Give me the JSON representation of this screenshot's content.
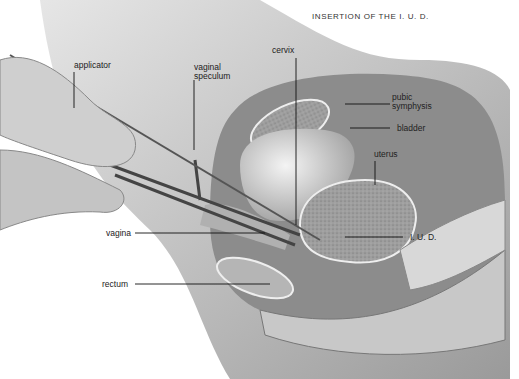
{
  "title": "INSERTION OF THE I. U. D.",
  "labels": {
    "applicator": "applicator",
    "vaginal_speculum_1": "vaginal",
    "vaginal_speculum_2": "speculum",
    "cervix": "cervix",
    "pubic_symphysis_1": "pubic",
    "pubic_symphysis_2": "symphysis",
    "bladder": "bladder",
    "uterus": "uterus",
    "vagina": "vagina",
    "iud": "I. U. D.",
    "rectum": "rectum"
  }
}
